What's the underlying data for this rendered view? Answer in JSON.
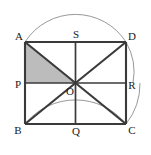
{
  "figure": {
    "background_color": "#ffffff",
    "stroke_color": "#3a3a3a",
    "arc_color": "#8c8c8c",
    "shaded_fill": "#b6b6b6",
    "label_color": "#1a1a1a",
    "rectangle": {
      "name": "ABCD",
      "corners": [
        {
          "id": "A",
          "label": "A",
          "x": 25,
          "y": 42,
          "label_x": 19,
          "label_y": 40
        },
        {
          "id": "D",
          "label": "D",
          "x": 126,
          "y": 42,
          "label_x": 129,
          "label_y": 40
        },
        {
          "id": "C",
          "label": "C",
          "x": 126,
          "y": 124,
          "label_x": 129,
          "label_y": 134
        },
        {
          "id": "B",
          "label": "B",
          "x": 25,
          "y": 124,
          "label_x": 16,
          "label_y": 134
        }
      ]
    },
    "midpoints": [
      {
        "id": "S",
        "label": "S",
        "on": "AD",
        "x": 75.5,
        "y": 42,
        "label_x": 74,
        "label_y": 38
      },
      {
        "id": "R",
        "label": "R",
        "on": "DC",
        "x": 126,
        "y": 83,
        "label_x": 129,
        "label_y": 89
      },
      {
        "id": "Q",
        "label": "Q",
        "on": "BC",
        "x": 75.5,
        "y": 124,
        "label_x": 74,
        "label_y": 134
      },
      {
        "id": "P",
        "label": "P",
        "on": "AB",
        "x": 25,
        "y": 83,
        "label_x": 16,
        "label_y": 89
      }
    ],
    "center": {
      "id": "O",
      "label": "O",
      "x": 75.5,
      "y": 83,
      "label_x": 74,
      "label_y": 95
    },
    "segments": [
      {
        "name": "side-AD",
        "from": "A",
        "to": "D"
      },
      {
        "name": "side-DC",
        "from": "D",
        "to": "C"
      },
      {
        "name": "side-CB",
        "from": "C",
        "to": "B"
      },
      {
        "name": "side-BA",
        "from": "B",
        "to": "A"
      },
      {
        "name": "diagonal-AC",
        "from": "A",
        "to": "C"
      },
      {
        "name": "diagonal-BD",
        "from": "B",
        "to": "D"
      },
      {
        "name": "midline-SQ",
        "from": "S",
        "to": "Q"
      },
      {
        "name": "midline-PR",
        "from": "P",
        "to": "R"
      }
    ],
    "shaded_region": {
      "name": "triangle-APO",
      "vertices": "A, P, O",
      "points": "25,42 25,83 75.5,83"
    },
    "arcs": [
      {
        "name": "outer-arc-through-B-and-C",
        "center": "O",
        "radius": 65.0,
        "description": "Large arc centred at O passing through B and C"
      },
      {
        "name": "inner-arc-through-A-and-D",
        "center": "Q",
        "radius": 60.0,
        "description": "Smaller arc passing through A and D"
      }
    ]
  }
}
